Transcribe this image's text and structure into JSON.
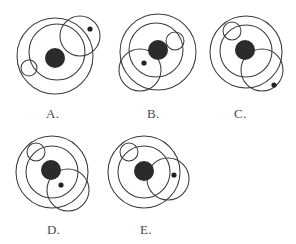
{
  "figure": {
    "background_color": "#ffffff",
    "stroke_color": "#3a3a3a",
    "fill_color": "#2b2b2b"
  },
  "options": [
    {
      "id": "A",
      "label": "A.",
      "label_x": 46,
      "label_y": 106,
      "origin_x": 8,
      "origin_y": 6,
      "width": 98,
      "height": 96,
      "shapes": [
        {
          "name": "outer-ring",
          "kind": "circle",
          "cx": 47,
          "cy": 50,
          "r": 38
        },
        {
          "name": "inner-ring",
          "kind": "circle",
          "cx": 49,
          "cy": 46,
          "r": 28
        },
        {
          "name": "satellite-large",
          "kind": "circle",
          "cx": 72,
          "cy": 30,
          "r": 20
        },
        {
          "name": "satellite-small",
          "kind": "circle",
          "cx": 21,
          "cy": 62,
          "r": 8
        },
        {
          "name": "core-dot",
          "kind": "disc",
          "cx": 47,
          "cy": 52,
          "r": 10
        },
        {
          "name": "speck-dot",
          "kind": "speck",
          "cx": 82,
          "cy": 23,
          "r": 2.6
        }
      ]
    },
    {
      "id": "B",
      "label": "B.",
      "label_x": 147,
      "label_y": 106,
      "origin_x": 110,
      "origin_y": 6,
      "width": 94,
      "height": 96,
      "shapes": [
        {
          "name": "outer-ring",
          "kind": "circle",
          "cx": 48,
          "cy": 46,
          "r": 38
        },
        {
          "name": "inner-ring",
          "kind": "circle",
          "cx": 46,
          "cy": 44,
          "r": 27
        },
        {
          "name": "satellite-small",
          "kind": "circle",
          "cx": 65,
          "cy": 35,
          "r": 9
        },
        {
          "name": "satellite-large",
          "kind": "circle",
          "cx": 30,
          "cy": 64,
          "r": 21
        },
        {
          "name": "core-dot",
          "kind": "disc",
          "cx": 48,
          "cy": 44,
          "r": 10
        },
        {
          "name": "speck-dot",
          "kind": "speck",
          "cx": 34,
          "cy": 57,
          "r": 2.6
        }
      ]
    },
    {
      "id": "C",
      "label": "C.",
      "label_x": 234,
      "label_y": 106,
      "origin_x": 204,
      "origin_y": 6,
      "width": 92,
      "height": 96,
      "shapes": [
        {
          "name": "outer-ring",
          "kind": "circle",
          "cx": 42,
          "cy": 46,
          "r": 36
        },
        {
          "name": "inner-ring",
          "kind": "circle",
          "cx": 42,
          "cy": 45,
          "r": 26
        },
        {
          "name": "satellite-small",
          "kind": "circle",
          "cx": 28,
          "cy": 25,
          "r": 9
        },
        {
          "name": "satellite-large",
          "kind": "circle",
          "cx": 58,
          "cy": 64,
          "r": 21
        },
        {
          "name": "core-dot",
          "kind": "disc",
          "cx": 41,
          "cy": 44,
          "r": 10
        },
        {
          "name": "speck-dot",
          "kind": "speck",
          "cx": 70,
          "cy": 79,
          "r": 2.6
        }
      ]
    },
    {
      "id": "D",
      "label": "D.",
      "label_x": 47,
      "label_y": 222,
      "origin_x": 10,
      "origin_y": 128,
      "width": 96,
      "height": 92,
      "shapes": [
        {
          "name": "outer-ring",
          "kind": "circle",
          "cx": 42,
          "cy": 44,
          "r": 36
        },
        {
          "name": "inner-ring",
          "kind": "circle",
          "cx": 42,
          "cy": 44,
          "r": 26
        },
        {
          "name": "satellite-small",
          "kind": "circle",
          "cx": 26,
          "cy": 24,
          "r": 9
        },
        {
          "name": "satellite-large",
          "kind": "circle",
          "cx": 58,
          "cy": 62,
          "r": 21
        },
        {
          "name": "core-dot",
          "kind": "disc",
          "cx": 41,
          "cy": 42,
          "r": 10
        },
        {
          "name": "speck-dot",
          "kind": "speck",
          "cx": 51,
          "cy": 57,
          "r": 2.6
        }
      ]
    },
    {
      "id": "E",
      "label": "E.",
      "label_x": 140,
      "label_y": 222,
      "origin_x": 102,
      "origin_y": 128,
      "width": 96,
      "height": 92,
      "shapes": [
        {
          "name": "outer-ring",
          "kind": "circle",
          "cx": 42,
          "cy": 44,
          "r": 36
        },
        {
          "name": "inner-ring",
          "kind": "circle",
          "cx": 42,
          "cy": 44,
          "r": 26
        },
        {
          "name": "satellite-small",
          "kind": "circle",
          "cx": 27,
          "cy": 24,
          "r": 9
        },
        {
          "name": "satellite-large",
          "kind": "circle",
          "cx": 66,
          "cy": 51,
          "r": 21
        },
        {
          "name": "core-dot",
          "kind": "disc",
          "cx": 42,
          "cy": 43,
          "r": 10
        },
        {
          "name": "speck-dot",
          "kind": "speck",
          "cx": 72,
          "cy": 47,
          "r": 2.6
        }
      ]
    }
  ]
}
